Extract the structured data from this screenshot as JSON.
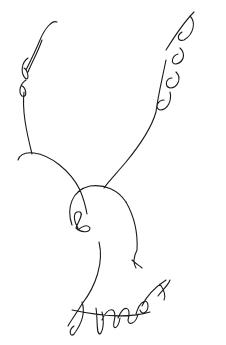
{
  "canvas": {
    "width": 226,
    "height": 345,
    "background": "#ffffff",
    "stroke_color": "#1a1a1a"
  },
  "drawing": {
    "subject": "bird sketch",
    "parts": [
      {
        "name": "left-wing",
        "d": "M57,22 C52,20 45,28 40,40 C35,52 30,62 26,70 M42,40 C38,52 32,62 28,72 M28,58 C22,62 20,72 25,78 C30,82 28,70 24,68 M26,80 C20,84 18,92 22,96 C28,98 26,88 22,86 M24,92 C22,110 26,130 32,154"
      },
      {
        "name": "left-wing-tip",
        "d": "M18,160 C20,154 26,152 34,153 C50,155 70,170 80,190"
      },
      {
        "name": "right-wing",
        "d": "M194,12 C186,20 176,34 166,50 M190,16 C196,22 194,34 184,40 C178,42 176,36 182,32 M180,48 C186,54 184,62 176,64 C170,64 172,56 178,54 M176,72 C182,78 178,88 170,88 C164,86 166,78 172,78 M170,92 C172,100 168,110 160,110 C154,108 158,100 164,100 M166,60 C162,80 158,95 156,112 C152,126 140,145 126,162 C115,175 108,182 104,188"
      },
      {
        "name": "head",
        "d": "M80,190 C84,200 86,208 87,214 M72,225 C66,208 72,190 90,186 C105,184 118,190 126,202 M78,228 C72,218 74,210 80,212 C84,214 78,222 76,228 C80,232 90,234 90,228 C88,224 82,226 78,230"
      },
      {
        "name": "body",
        "d": "M126,202 C134,216 138,232 137,250 M137,250 C134,256 132,262 136,268 M132,260 C136,264 140,266 142,268 M99,242 C104,262 96,286 82,304 C76,314 70,322 68,326"
      },
      {
        "name": "tail-feathers",
        "d": "M72,310 C100,316 130,318 150,312 M82,302 C86,314 80,326 74,334 C70,338 68,330 74,326 M96,308 C98,322 96,334 100,334 C104,330 104,318 102,312 M102,320 C108,306 118,306 114,322 C112,330 118,330 120,318 M118,318 C124,304 132,306 128,320 C128,326 136,324 138,314 M136,314 C140,300 148,298 148,306 C148,312 142,316 140,310 M142,306 C148,292 160,284 166,280 M158,296 C162,290 168,286 170,280 M160,284 C164,290 166,296 164,300"
      }
    ]
  }
}
